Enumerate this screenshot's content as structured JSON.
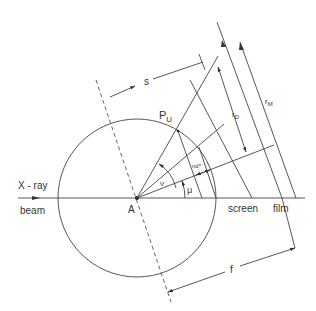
{
  "diagram": {
    "type": "geometry-schematic",
    "labels": {
      "xray": "X - ray",
      "beam": "beam",
      "center": "A",
      "point": "P",
      "point_sub": "U",
      "s": "s",
      "f": "f",
      "rD": "r",
      "rD_sub": "D",
      "rM": "r",
      "rM_sub": "M",
      "screen": "screen",
      "film": "film",
      "nu": "ν",
      "mu": "μ",
      "nd": "nd*"
    },
    "colors": {
      "line": "#444444",
      "text": "#333333",
      "background": "#ffffff"
    },
    "geometry": {
      "center": [
        137,
        198
      ],
      "circle_radius": 79
    }
  }
}
